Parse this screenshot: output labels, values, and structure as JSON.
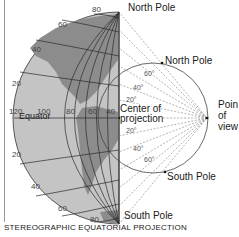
{
  "title": "STEREOGRAPHIC EQUATORIAL PROJECTION",
  "globe": {
    "labels": {
      "north_pole": "North Pole",
      "south_pole": "South Pole",
      "equator": "Equator"
    },
    "latitude_ticks": [
      "80",
      "60",
      "40",
      "20",
      "20",
      "40",
      "60",
      "80"
    ],
    "longitude_ticks": [
      "120",
      "100",
      "80",
      "60",
      "40"
    ]
  },
  "projection": {
    "labels": {
      "north_pole": "North Pole",
      "south_pole": "South Pole",
      "center": "Center of projection",
      "center_line1": "Center of",
      "center_line2": "projection",
      "point_of_view_line1": "Poin",
      "point_of_view_line2": "of",
      "point_of_view_line3": "view"
    },
    "angle_ticks": [
      "60°",
      "40°",
      "20°",
      "20°",
      "40°",
      "60°"
    ]
  },
  "colors": {
    "land": "#8c8c8c",
    "ocean": "#c4c4c4",
    "grid": "#2a2a2a",
    "rays": "#666666"
  }
}
